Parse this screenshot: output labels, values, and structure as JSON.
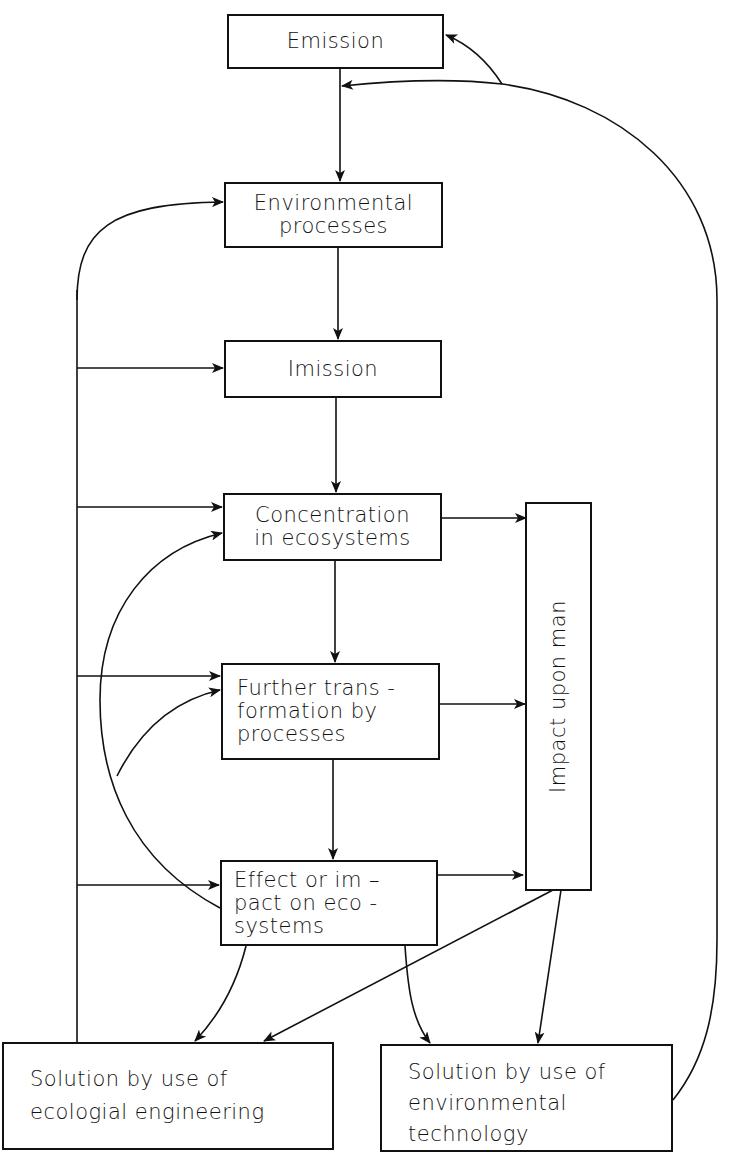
{
  "diagram": {
    "nodes": {
      "emission": {
        "lines": [
          "Emission"
        ]
      },
      "env_processes": {
        "lines": [
          "Environmental",
          "processes"
        ]
      },
      "imission": {
        "lines": [
          "Imission"
        ]
      },
      "concentration": {
        "lines": [
          "Concentration",
          "in ecosystems"
        ]
      },
      "further": {
        "lines": [
          "Further trans -",
          "formation by",
          "processes"
        ]
      },
      "effect": {
        "lines": [
          "Effect or im  –",
          "pact on eco -",
          "systems"
        ]
      },
      "impact_man": {
        "lines": [
          "Impact upon man"
        ]
      },
      "eco_eng": {
        "lines": [
          "Solution by use of",
          "ecologial engineering"
        ]
      },
      "env_tech": {
        "lines": [
          "Solution by use of",
          "environmental",
          "technology"
        ]
      }
    },
    "edges": [
      {
        "from": "emission",
        "to": "env_processes"
      },
      {
        "from": "env_processes",
        "to": "imission"
      },
      {
        "from": "imission",
        "to": "concentration"
      },
      {
        "from": "concentration",
        "to": "further"
      },
      {
        "from": "further",
        "to": "effect"
      },
      {
        "from": "concentration",
        "to": "impact_man"
      },
      {
        "from": "further",
        "to": "impact_man"
      },
      {
        "from": "effect",
        "to": "impact_man"
      },
      {
        "from": "effect",
        "to": "eco_eng"
      },
      {
        "from": "effect",
        "to": "env_tech"
      },
      {
        "from": "impact_man",
        "to": "eco_eng"
      },
      {
        "from": "impact_man",
        "to": "env_tech"
      },
      {
        "from": "eco_eng",
        "to": "env_processes"
      },
      {
        "from": "eco_eng",
        "to": "imission"
      },
      {
        "from": "eco_eng",
        "to": "concentration"
      },
      {
        "from": "eco_eng",
        "to": "further"
      },
      {
        "from": "eco_eng",
        "to": "effect"
      },
      {
        "from": "effect",
        "to": "concentration"
      },
      {
        "from": "effect",
        "to": "further"
      },
      {
        "from": "env_tech",
        "to": "emission"
      },
      {
        "from": "env_tech",
        "to": "emission-to-env_processes link"
      }
    ],
    "colors": {
      "line": "#111111",
      "background": "#ffffff"
    }
  }
}
